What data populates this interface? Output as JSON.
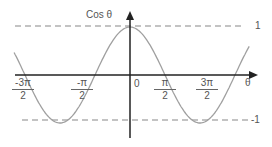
{
  "chart_data": {
    "type": "line",
    "title": "Cos θ",
    "xlabel": "θ",
    "ylabel": "Cos θ",
    "function": "cos(θ)",
    "x_range_radians": [
      -5.5,
      5.5
    ],
    "ylim": [
      -1,
      1
    ],
    "x_ticks": [
      {
        "value": "-3π/2",
        "num": "-3π",
        "den": "2"
      },
      {
        "value": "-π/2",
        "num": "-π",
        "den": "2"
      },
      {
        "value": "0",
        "num": "0",
        "den": ""
      },
      {
        "value": "π/2",
        "num": "π",
        "den": "2"
      },
      {
        "value": "3π/2",
        "num": "3π",
        "den": "2"
      }
    ],
    "reference_lines": [
      {
        "y": 1,
        "label": "1",
        "style": "dashed"
      },
      {
        "y": -1,
        "label": "-1",
        "style": "dashed"
      }
    ],
    "grid": false,
    "legend": "none"
  },
  "labels": {
    "y_axis": "Cos θ",
    "x_axis": "θ",
    "origin": "0",
    "upper": "1",
    "lower": "-1"
  },
  "colors": {
    "curve": "#999999",
    "axes": "#222222",
    "dash": "#888888",
    "text": "#555555"
  }
}
